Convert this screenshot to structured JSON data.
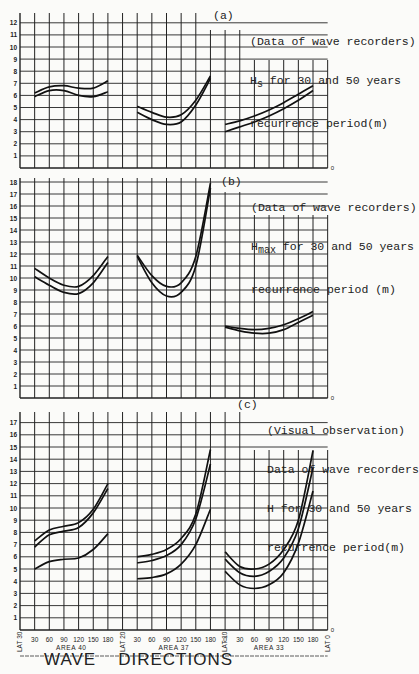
{
  "chart_data": [
    {
      "type": "line",
      "panel": "(a)",
      "title": "(Data of wave recorders) Hs for 30 and 50 years recurrence period(m)",
      "ylabel": "Hs (m)",
      "xlabel": "WAVE DIRECTIONS",
      "ylim": [
        0,
        12
      ],
      "yticks": [
        1,
        2,
        3,
        4,
        5,
        6,
        7,
        8,
        9,
        10,
        11,
        12
      ],
      "grid": true,
      "groups": [
        {
          "area": "AREA 40",
          "x": [
            30,
            60,
            90,
            120,
            150,
            180
          ],
          "series": [
            {
              "name": "50 years",
              "values": [
                6.2,
                6.7,
                6.8,
                6.6,
                6.6,
                7.2
              ]
            },
            {
              "name": "30 years",
              "values": [
                5.9,
                6.4,
                6.4,
                6.0,
                5.9,
                6.3
              ]
            }
          ]
        },
        {
          "area": "AREA 37",
          "x": [
            30,
            60,
            90,
            120,
            150,
            180
          ],
          "series": [
            {
              "name": "50 years",
              "values": [
                5.1,
                4.6,
                4.2,
                4.4,
                5.6,
                7.6
              ]
            },
            {
              "name": "30 years",
              "values": [
                4.6,
                4.0,
                3.6,
                3.8,
                5.2,
                7.4
              ]
            }
          ]
        },
        {
          "area": "AREA 33",
          "x": [
            0,
            30,
            60,
            90,
            120,
            150,
            180
          ],
          "series": [
            {
              "name": "50 years",
              "values": [
                3.6,
                3.9,
                4.3,
                4.8,
                5.4,
                6.1,
                6.8
              ]
            },
            {
              "name": "30 years",
              "values": [
                3.0,
                3.4,
                3.8,
                4.3,
                4.9,
                5.6,
                6.4
              ]
            }
          ]
        }
      ]
    },
    {
      "type": "line",
      "panel": "(b)",
      "title": "(Data of wave recorders) Hmax for 30 and 50 years recurrence period (m)",
      "ylabel": "Hmax (m)",
      "xlabel": "WAVE DIRECTIONS",
      "ylim": [
        0,
        18
      ],
      "yticks": [
        1,
        2,
        3,
        4,
        5,
        6,
        7,
        8,
        9,
        10,
        11,
        12,
        13,
        14,
        15,
        16,
        17,
        18
      ],
      "grid": true,
      "groups": [
        {
          "area": "AREA 40",
          "x": [
            30,
            60,
            90,
            120,
            150,
            180
          ],
          "series": [
            {
              "name": "50 years",
              "values": [
                10.8,
                10.0,
                9.4,
                9.3,
                10.2,
                11.8
              ]
            },
            {
              "name": "30 years",
              "values": [
                10.1,
                9.4,
                8.8,
                8.7,
                9.6,
                11.3
              ]
            }
          ]
        },
        {
          "area": "AREA 37",
          "x": [
            30,
            60,
            90,
            120,
            150,
            180
          ],
          "series": [
            {
              "name": "50 years",
              "values": [
                11.9,
                10.2,
                9.3,
                9.6,
                11.8,
                17.9
              ]
            },
            {
              "name": "30 years",
              "values": [
                11.8,
                9.6,
                8.5,
                8.8,
                11.0,
                17.5
              ]
            }
          ]
        },
        {
          "area": "AREA 33",
          "x": [
            0,
            30,
            60,
            90,
            120,
            150,
            180
          ],
          "series": [
            {
              "name": "50 years",
              "values": [
                6.0,
                5.8,
                5.7,
                5.8,
                6.1,
                6.6,
                7.2
              ]
            },
            {
              "name": "30 years",
              "values": [
                5.9,
                5.6,
                5.4,
                5.4,
                5.7,
                6.3,
                6.9
              ]
            }
          ]
        }
      ]
    },
    {
      "type": "line",
      "panel": "(c)",
      "title": "(Visual observation) Data of wave recorders H for 30 and 50 years recurrence period(m)",
      "ylabel": "H (m)",
      "xlabel": "WAVE DIRECTIONS",
      "ylim": [
        0,
        17
      ],
      "yticks": [
        1,
        2,
        3,
        4,
        5,
        6,
        7,
        8,
        9,
        10,
        11,
        12,
        13,
        14,
        15,
        16,
        17
      ],
      "grid": true,
      "groups": [
        {
          "area": "AREA 40",
          "x": [
            30,
            60,
            90,
            120,
            150,
            180
          ],
          "series": [
            {
              "name": "upper",
              "values": [
                7.3,
                8.2,
                8.5,
                8.8,
                9.9,
                12.0
              ]
            },
            {
              "name": "middle",
              "values": [
                6.8,
                7.8,
                8.1,
                8.4,
                9.6,
                11.6
              ]
            },
            {
              "name": "lower",
              "values": [
                5.0,
                5.6,
                5.8,
                5.9,
                6.6,
                7.9
              ]
            }
          ]
        },
        {
          "area": "AREA 37",
          "x": [
            30,
            60,
            90,
            120,
            150,
            180
          ],
          "series": [
            {
              "name": "upper",
              "values": [
                6.0,
                6.2,
                6.6,
                7.5,
                9.5,
                14.8
              ]
            },
            {
              "name": "middle",
              "values": [
                5.5,
                5.7,
                6.1,
                7.0,
                9.1,
                13.6
              ]
            },
            {
              "name": "lower",
              "values": [
                4.2,
                4.3,
                4.6,
                5.4,
                7.0,
                9.9
              ]
            }
          ]
        },
        {
          "area": "AREA 33",
          "x": [
            0,
            30,
            60,
            90,
            120,
            150,
            180
          ],
          "series": [
            {
              "name": "upper",
              "values": [
                6.4,
                5.2,
                5.0,
                5.4,
                6.6,
                9.0,
                14.7
              ]
            },
            {
              "name": "middle",
              "values": [
                5.8,
                4.7,
                4.4,
                4.8,
                5.9,
                8.3,
                13.3
              ]
            },
            {
              "name": "lower",
              "values": [
                4.8,
                3.7,
                3.4,
                3.7,
                4.7,
                7.1,
                11.4
              ]
            }
          ]
        }
      ]
    }
  ],
  "panels": {
    "a": {
      "label": "(a)",
      "line1": "(Data of wave recorders)",
      "line2_pre": "H",
      "line2_sub": "s",
      "line2_post": " for 30 and 50 years",
      "line3": "recurrence period(m)"
    },
    "b": {
      "label": "(b)",
      "line1": "(Data of wave recorders)",
      "line2_pre": "H",
      "line2_sub": "max",
      "line2_post": " for 30 and 50 years",
      "line3": "recurrence period (m)"
    },
    "c": {
      "label": "(c)",
      "line1": "(Visual observation)",
      "line2": "Data of wave recorders",
      "line3": "H for 30 and 50 years",
      "line4": "recurrence period(m)"
    }
  },
  "x_axis": {
    "lat_labels": [
      "LAT 30",
      "LAT 20",
      "LAT 10",
      "LAT 0"
    ],
    "areas": [
      {
        "name": "AREA 40",
        "ticks": [
          "30",
          "60",
          "90",
          "120",
          "150",
          "180"
        ]
      },
      {
        "name": "AREA 37",
        "ticks": [
          "30",
          "60",
          "90",
          "120",
          "150",
          "180"
        ]
      },
      {
        "name": "AREA 33",
        "ticks": [
          "0",
          "30",
          "60",
          "90",
          "120",
          "150",
          "180"
        ]
      }
    ],
    "zero_label": "0"
  },
  "footer": {
    "word1": "WAVE",
    "word2": "DIRECTIONS"
  }
}
